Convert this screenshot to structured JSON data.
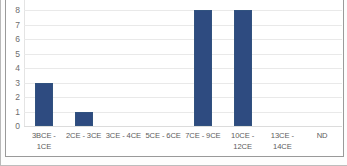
{
  "chart_data": {
    "type": "bar",
    "title": "",
    "subtitle": "",
    "xlabel": "",
    "ylabel": "",
    "categories": [
      "3BCE - 1CE",
      "2CE - 3CE",
      "3CE - 4CE",
      "5CE - 6CE",
      "7CE - 9CE",
      "10CE -\n12CE",
      "13CE -\n14CE",
      "ND"
    ],
    "values": [
      3,
      1,
      0,
      0,
      8,
      8,
      0,
      0
    ],
    "ylim": [
      0,
      9
    ],
    "yticks": [
      0,
      1,
      2,
      3,
      4,
      5,
      6,
      7,
      8,
      9
    ],
    "ytick_labels": [
      "0",
      "1",
      "2",
      "3",
      "4",
      "5",
      "6",
      "7",
      "8",
      "9"
    ],
    "grid": true,
    "legend": false,
    "legend_position": "none",
    "series": [
      {
        "name": "Count",
        "color": "#2E4B80",
        "values": [
          3,
          1,
          0,
          0,
          8,
          8,
          0,
          0
        ]
      }
    ],
    "colors": {
      "bar": "#2E4B80",
      "bar_border": "#31527F",
      "gridline": "#E9E9E9",
      "plot_background": "#FFFFFF",
      "axis_text": "#5C5C5C",
      "chart_border": "#9A9A9A"
    }
  }
}
